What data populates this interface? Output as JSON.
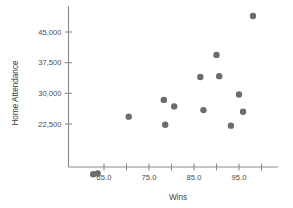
{
  "chart_data": {
    "type": "scatter",
    "title": "",
    "xlabel": "Wins",
    "ylabel": "Home Attendance",
    "xlim": [
      60,
      103
    ],
    "ylim": [
      8000,
      50500
    ],
    "grid": false,
    "legend": null,
    "xticks": [
      65.0,
      70.0,
      75.0,
      80.0,
      85.0,
      90.0,
      95.0,
      100.0
    ],
    "xtick_labels": [
      "65.0",
      "",
      "75.0",
      "",
      "85.0",
      "",
      "95.0",
      ""
    ],
    "yticks": [
      22500,
      30000,
      37500,
      45000
    ],
    "ytick_labels": [
      "22,500",
      "30,000",
      "37,500",
      "45,000"
    ],
    "marker_color": "#6b6b70",
    "marker_size": 3.2,
    "points": [
      {
        "x": 62.6,
        "y": 10200
      },
      {
        "x": 63.6,
        "y": 10400
      },
      {
        "x": 70.5,
        "y": 24300
      },
      {
        "x": 78.3,
        "y": 28400
      },
      {
        "x": 78.6,
        "y": 22300
      },
      {
        "x": 80.6,
        "y": 26800
      },
      {
        "x": 86.4,
        "y": 34000
      },
      {
        "x": 87.1,
        "y": 25900
      },
      {
        "x": 90.0,
        "y": 39400
      },
      {
        "x": 90.6,
        "y": 34200
      },
      {
        "x": 93.2,
        "y": 22100
      },
      {
        "x": 95.0,
        "y": 29700
      },
      {
        "x": 95.9,
        "y": 25500
      },
      {
        "x": 98.1,
        "y": 48900
      }
    ]
  }
}
